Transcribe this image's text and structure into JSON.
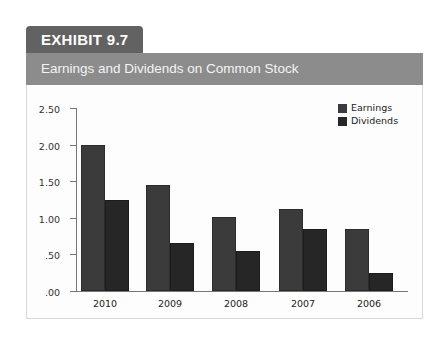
{
  "exhibit": {
    "tab_label": "EXHIBIT 9.7",
    "title": "Earnings and Dividends on Common Stock"
  },
  "colors": {
    "tab_bg": "#626262",
    "banner_bg": "#8c8c8c",
    "earnings": "#3b3b3b",
    "dividends": "#262626",
    "axis": "#777777"
  },
  "chart_data": {
    "type": "bar",
    "title": "Earnings and Dividends on Common Stock",
    "xlabel": "",
    "ylabel": "",
    "categories": [
      "2010",
      "2009",
      "2008",
      "2007",
      "2006"
    ],
    "series": [
      {
        "name": "Earnings",
        "values": [
          2.0,
          1.45,
          1.01,
          1.12,
          0.85
        ]
      },
      {
        "name": "Dividends",
        "values": [
          1.25,
          0.65,
          0.55,
          0.85,
          0.25
        ]
      }
    ],
    "ylim": [
      0,
      2.5
    ],
    "yticks": [
      ".00",
      ".50",
      "1.00",
      "1.50",
      "2.00",
      "2.50"
    ],
    "ytick_values": [
      0,
      0.5,
      1.0,
      1.5,
      2.0,
      2.5
    ],
    "grid": false,
    "legend_position": "top-right"
  },
  "legend": {
    "items": [
      {
        "label": "Earnings"
      },
      {
        "label": "Dividends"
      }
    ]
  }
}
